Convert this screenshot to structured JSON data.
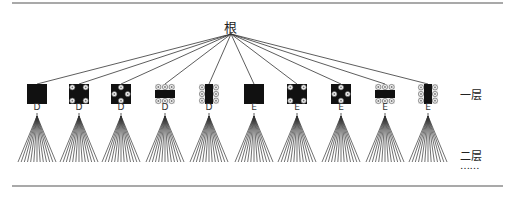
{
  "diagram": {
    "root_label": "根",
    "layer_labels": [
      "一层",
      "二层",
      "……"
    ],
    "colors": {
      "line": "#333333",
      "fill": "#111111",
      "rule": "#555555",
      "dot": "#eeeeee"
    },
    "nodes": [
      {
        "x": 37,
        "label": "D",
        "pattern": "solid"
      },
      {
        "x": 79,
        "label": "D",
        "pattern": "corners"
      },
      {
        "x": 121,
        "label": "D",
        "pattern": "diamond"
      },
      {
        "x": 165,
        "label": "D",
        "pattern": "top-bottom-rows"
      },
      {
        "x": 209,
        "label": "D",
        "pattern": "left-right-cols"
      },
      {
        "x": 254,
        "label": "E",
        "pattern": "solid"
      },
      {
        "x": 297,
        "label": "E",
        "pattern": "corners"
      },
      {
        "x": 341,
        "label": "E",
        "pattern": "diamond"
      },
      {
        "x": 385,
        "label": "E",
        "pattern": "top-bottom-rows"
      },
      {
        "x": 428,
        "label": "E",
        "pattern": "left-right-cols"
      }
    ],
    "root_point": {
      "x": 231,
      "y": 34
    },
    "fan_branches": 13
  }
}
